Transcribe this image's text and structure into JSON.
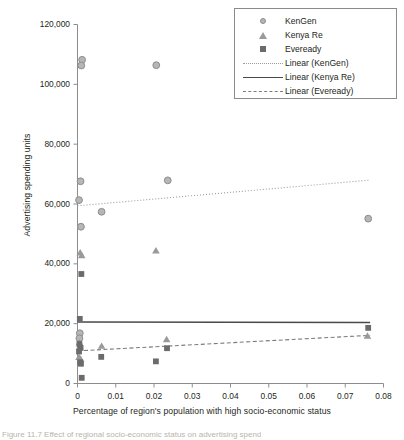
{
  "chart_data": {
    "type": "scatter",
    "title": "",
    "xlabel": "Percentage of region's population with high socio-economic status",
    "ylabel": "Advertising spending units",
    "xlim": [
      0,
      0.08
    ],
    "ylim": [
      0,
      120000
    ],
    "xticks": [
      0,
      0.01,
      0.02,
      0.03,
      0.04,
      0.05,
      0.06,
      0.07,
      0.08
    ],
    "xtick_labels": [
      "0",
      "0.01",
      "0.02",
      "0.03",
      "0.04",
      "0.05",
      "0.06",
      "0.07",
      "0.08"
    ],
    "yticks": [
      0,
      20000,
      40000,
      60000,
      80000,
      100000,
      120000
    ],
    "ytick_labels": [
      "0",
      "20,000",
      "40,000",
      "60,000",
      "80,000",
      "100,000",
      "120,000"
    ],
    "grid": false,
    "legend_position": "top-right",
    "series": [
      {
        "name": "KenGen",
        "marker": "circle",
        "color": "#b6b6b6",
        "edge_color": "#8d8d8d",
        "points": [
          {
            "x": 0.0012,
            "y": 108200
          },
          {
            "x": 0.001,
            "y": 106300
          },
          {
            "x": 0.0206,
            "y": 106400
          },
          {
            "x": 0.0008,
            "y": 67600
          },
          {
            "x": 0.0004,
            "y": 61300
          },
          {
            "x": 0.0236,
            "y": 67900
          },
          {
            "x": 0.0063,
            "y": 57400
          },
          {
            "x": 0.0009,
            "y": 52400
          },
          {
            "x": 0.076,
            "y": 55100
          },
          {
            "x": 0.0006,
            "y": 16800
          },
          {
            "x": 0.0005,
            "y": 15100
          }
        ]
      },
      {
        "name": "Kenya Re",
        "marker": "triangle",
        "color": "#9a9a9a",
        "points": [
          {
            "x": 0.0007,
            "y": 43600
          },
          {
            "x": 0.0011,
            "y": 42700
          },
          {
            "x": 0.0205,
            "y": 44300
          },
          {
            "x": 0.0005,
            "y": 13600
          },
          {
            "x": 0.0006,
            "y": 12100
          },
          {
            "x": 0.0063,
            "y": 12400
          },
          {
            "x": 0.0233,
            "y": 14600
          },
          {
            "x": 0.0758,
            "y": 15800
          },
          {
            "x": 0.0004,
            "y": 8700
          },
          {
            "x": 0.0008,
            "y": 8100
          }
        ]
      },
      {
        "name": "Eveready",
        "marker": "square",
        "color": "#6b6b6b",
        "points": [
          {
            "x": 0.001,
            "y": 36600
          },
          {
            "x": 0.0006,
            "y": 21600
          },
          {
            "x": 0.0005,
            "y": 13200
          },
          {
            "x": 0.0008,
            "y": 11900
          },
          {
            "x": 0.0004,
            "y": 10700
          },
          {
            "x": 0.0007,
            "y": 7100
          },
          {
            "x": 0.0009,
            "y": 6600
          },
          {
            "x": 0.0062,
            "y": 8900
          },
          {
            "x": 0.0205,
            "y": 7400
          },
          {
            "x": 0.0234,
            "y": 11800
          },
          {
            "x": 0.076,
            "y": 18600
          },
          {
            "x": 0.0011,
            "y": 1900
          }
        ]
      }
    ],
    "trendlines": [
      {
        "name": "Linear (KenGen)",
        "style": "dotted",
        "color": "#9b9b9b",
        "x0": 0.0,
        "y0": 59400,
        "x1": 0.0765,
        "y1": 68000
      },
      {
        "name": "Linear (Kenya Re)",
        "style": "solid",
        "color": "#4a4a4a",
        "x0": 0.0,
        "y0": 20550,
        "x1": 0.0765,
        "y1": 20400
      },
      {
        "name": "Linear (Eveready)",
        "style": "dashed",
        "color": "#7c7c7c",
        "x0": 0.0,
        "y0": 10900,
        "x1": 0.0765,
        "y1": 16100
      }
    ],
    "legend_entries": [
      {
        "label": "KenGen",
        "key": "circle-marker"
      },
      {
        "label": "Kenya Re",
        "key": "triangle-marker"
      },
      {
        "label": "Eveready",
        "key": "square-marker"
      },
      {
        "label": "Linear (KenGen)",
        "key": "dotted-line"
      },
      {
        "label": "Linear (Kenya Re)",
        "key": "solid-line"
      },
      {
        "label": "Linear (Eveready)",
        "key": "dashed-line"
      }
    ]
  },
  "caption": "Figure 11.7  Effect of regional socio-economic status on advertising spend"
}
